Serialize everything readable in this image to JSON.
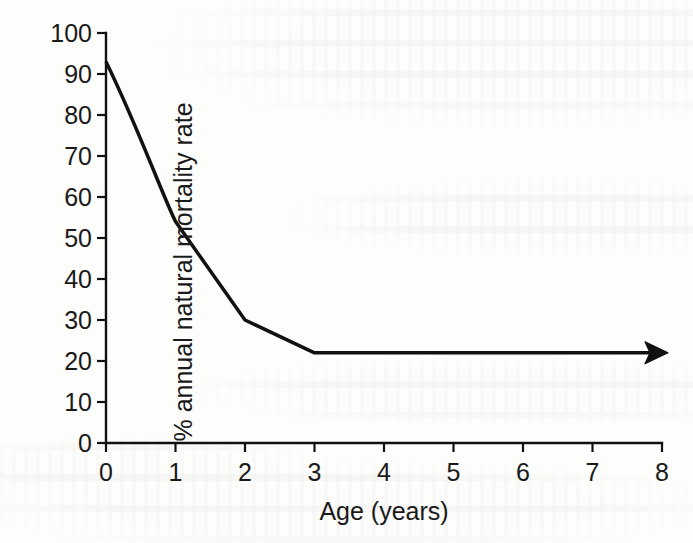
{
  "figure": {
    "background_color": "#fdfdfc",
    "ink_color": "#1a1a1a"
  },
  "chart_data": {
    "type": "line",
    "title": "",
    "xlabel": "Age (years)",
    "ylabel": "% annual natural mortality rate",
    "xlim": [
      0,
      8
    ],
    "ylim": [
      0,
      100
    ],
    "xticks": [
      0,
      1,
      2,
      3,
      4,
      5,
      6,
      7,
      8
    ],
    "xtick_labels": [
      "0",
      "1",
      "2",
      "3",
      "4",
      "5",
      "6",
      "7",
      "8"
    ],
    "yticks": [
      0,
      10,
      20,
      30,
      40,
      50,
      60,
      70,
      80,
      90,
      100
    ],
    "ytick_labels": [
      "0",
      "10",
      "20",
      "30",
      "40",
      "50",
      "60",
      "70",
      "80",
      "90",
      "100"
    ],
    "grid": false,
    "legend": false,
    "legend_position": "none",
    "line_color": "#111111",
    "line_width": 3.5,
    "markers": false,
    "arrow_at_end": true,
    "arrow_direction": "right",
    "annotations": [],
    "series": [
      {
        "name": "annual natural mortality rate",
        "x": [
          0,
          1,
          2,
          3,
          4,
          5,
          6,
          7,
          8
        ],
        "values": [
          93,
          54,
          30,
          22,
          22,
          22,
          22,
          22,
          22
        ]
      }
    ],
    "x": [
      0,
      1,
      2,
      3,
      4,
      5,
      6,
      7,
      8
    ],
    "values": [
      93,
      54,
      30,
      22,
      22,
      22,
      22,
      22,
      22
    ]
  }
}
